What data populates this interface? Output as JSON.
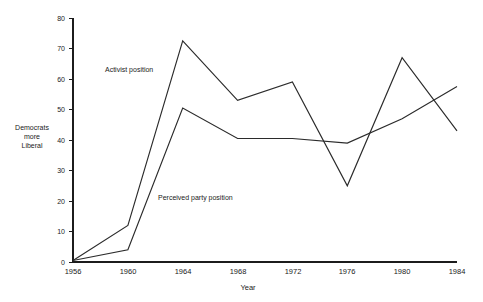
{
  "chart_data": {
    "type": "line",
    "title": "",
    "subtitle": "",
    "xlabel": "Year",
    "ylabel": "Democrats more Liberal",
    "ylabel_lines": [
      "Democrats",
      "more",
      "Liberal"
    ],
    "x": [
      1956,
      1960,
      1964,
      1968,
      1972,
      1976,
      1980,
      1984
    ],
    "xtick_labels": [
      "1956",
      "1960",
      "1964",
      "1968",
      "1972",
      "1976",
      "1980",
      "1984"
    ],
    "ytick_labels": [
      "0",
      "10",
      "20",
      "30",
      "40",
      "50",
      "60",
      "70",
      "80"
    ],
    "yticks": [
      0,
      10,
      20,
      30,
      40,
      50,
      60,
      70,
      80
    ],
    "xlim": [
      1956,
      1984
    ],
    "ylim": [
      0,
      80
    ],
    "grid": false,
    "legend_position": "inline-annotations",
    "series": [
      {
        "name": "Activist position",
        "values": [
          0.5,
          12,
          72.5,
          53,
          59,
          25,
          67,
          43
        ],
        "color": "#2b2b2b"
      },
      {
        "name": "Perceived party position",
        "values": [
          0.5,
          4,
          50.5,
          40.5,
          40.5,
          39,
          47,
          57.5
        ],
        "color": "#2b2b2b"
      }
    ],
    "annotations": [
      {
        "text": "Activist position",
        "x": 1957.6,
        "y": 62.5
      },
      {
        "text": "Perceived party position",
        "x": 1959.8,
        "y": 20.5
      }
    ]
  }
}
